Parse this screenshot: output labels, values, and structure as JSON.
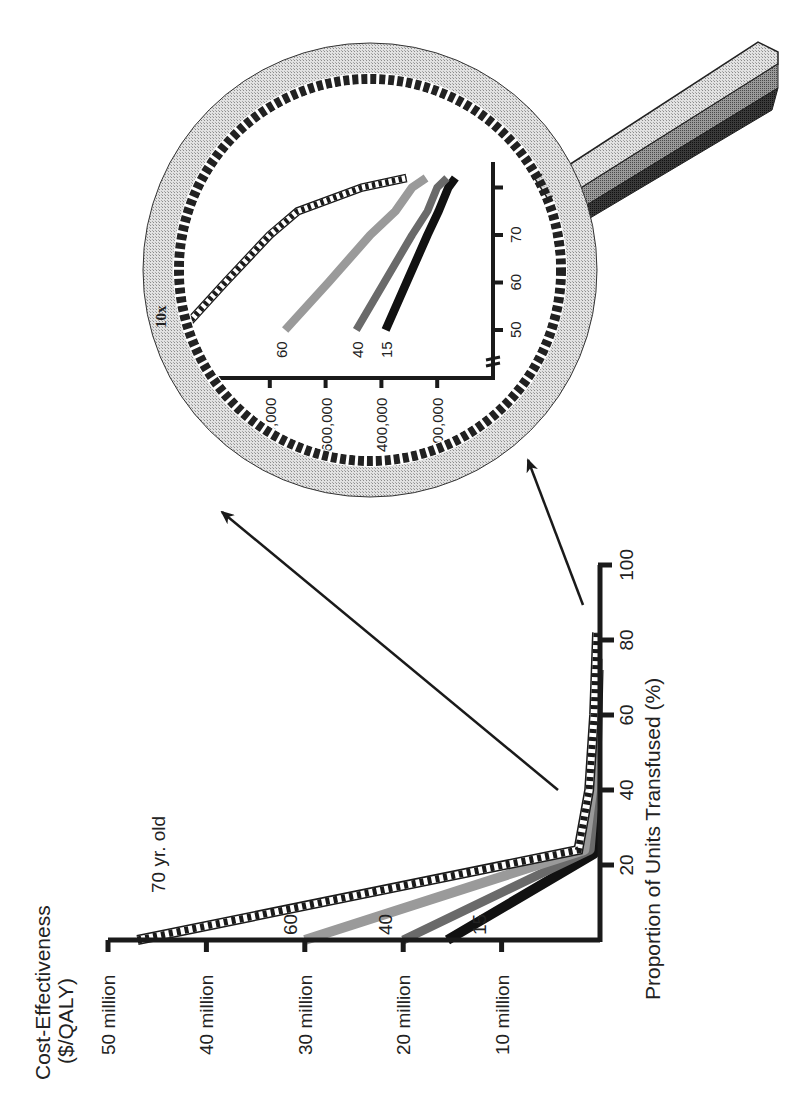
{
  "colors": {
    "axis": "#1a1a1a",
    "series_70": "#1a1a1a",
    "series_60": "#8a8a8a",
    "series_40": "#6e6e6e",
    "series_15": "#111111",
    "ring_outer": "#cfcfcf",
    "ring_inner": "#222222",
    "handle_light": "#d8d8d8",
    "handle_mid": "#9a9a9a",
    "handle_dark": "#2a2a2a"
  },
  "figure": {
    "orientation": "rotated 90° counter-clockwise",
    "magnifier_label": "10x"
  },
  "chart_data": [
    {
      "type": "line",
      "title": "",
      "ylabel_line1": "Cost-Effectiveness",
      "ylabel_line2": "($/QALY)",
      "xlabel": "Proportion of Units Transfused (%)",
      "ylim": [
        0,
        50000000
      ],
      "xlim": [
        0,
        100
      ],
      "yticks": [
        {
          "value": 10,
          "label": "10 million"
        },
        {
          "value": 20,
          "label": "20 million"
        },
        {
          "value": 30,
          "label": "30 million"
        },
        {
          "value": 40,
          "label": "40 million"
        },
        {
          "value": 50,
          "label": "50 million"
        }
      ],
      "xticks": [
        {
          "value": 20,
          "label": "20"
        },
        {
          "value": 40,
          "label": "40"
        },
        {
          "value": 60,
          "label": "60"
        },
        {
          "value": 80,
          "label": "80"
        },
        {
          "value": 100,
          "label": "100"
        }
      ],
      "y_units": "millions of $/QALY",
      "series": [
        {
          "name": "70 yr. old",
          "label": "70 yr. old",
          "style": "checkered-dashed",
          "points": [
            [
              0,
              47
            ],
            [
              24,
              2.2
            ],
            [
              40,
              1.1
            ],
            [
              60,
              0.6
            ],
            [
              82,
              0.3
            ]
          ]
        },
        {
          "name": "60",
          "label": "60",
          "style": "light-gray-thick",
          "points": [
            [
              0,
              30
            ],
            [
              24,
              1.6
            ],
            [
              40,
              0.8
            ],
            [
              60,
              0.4
            ],
            [
              75,
              0.25
            ]
          ]
        },
        {
          "name": "40",
          "label": "40",
          "style": "mid-gray-thick",
          "points": [
            [
              0,
              20
            ],
            [
              24,
              1.0
            ],
            [
              40,
              0.5
            ],
            [
              60,
              0.3
            ],
            [
              75,
              0.2
            ]
          ]
        },
        {
          "name": "15",
          "label": "15",
          "style": "black-thick",
          "points": [
            [
              0,
              15.5
            ],
            [
              23,
              0.6
            ],
            [
              40,
              0.4
            ],
            [
              60,
              0.25
            ],
            [
              72,
              0.15
            ]
          ]
        }
      ]
    },
    {
      "type": "line",
      "title": "10x inset (magnified view)",
      "xlabel": "Proportion of Units Transfused (%)",
      "ylabel": "Cost-Effectiveness ($/QALY)",
      "xlim": [
        45,
        85
      ],
      "ylim": [
        0,
        1100000
      ],
      "yticks": [
        {
          "value": 200,
          "label": "200,000"
        },
        {
          "value": 400,
          "label": "400,000"
        },
        {
          "value": 600,
          "label": "600,000"
        },
        {
          "value": 800,
          "label": "800,000"
        },
        {
          "value": 1000,
          "label": ""
        }
      ],
      "xticks": [
        {
          "value": 50,
          "label": "50"
        },
        {
          "value": 60,
          "label": "60"
        },
        {
          "value": 70,
          "label": "70"
        },
        {
          "value": 80,
          "label": ""
        }
      ],
      "y_units": "thousands of $/QALY",
      "axis_break": true,
      "series": [
        {
          "name": "70",
          "label": "70",
          "style": "checkered-dashed",
          "points": [
            [
              50,
              1115
            ],
            [
              60,
              960
            ],
            [
              70,
              800
            ],
            [
              75,
              700
            ],
            [
              80,
              470
            ],
            [
              82,
              310
            ]
          ]
        },
        {
          "name": "60",
          "label": "60",
          "style": "light-gray-thick",
          "points": [
            [
              50,
              745
            ],
            [
              60,
              590
            ],
            [
              70,
              440
            ],
            [
              75,
              350
            ],
            [
              80,
              290
            ],
            [
              82,
              240
            ]
          ]
        },
        {
          "name": "40",
          "label": "40",
          "style": "mid-gray-thick",
          "points": [
            [
              50,
              490
            ],
            [
              60,
              390
            ],
            [
              70,
              290
            ],
            [
              75,
              235
            ],
            [
              80,
              200
            ],
            [
              82,
              165
            ]
          ]
        },
        {
          "name": "15",
          "label": "15",
          "style": "black-thick",
          "points": [
            [
              50,
              385
            ],
            [
              60,
              310
            ],
            [
              70,
              235
            ],
            [
              75,
              195
            ],
            [
              80,
              160
            ],
            [
              82,
              135
            ]
          ]
        }
      ]
    }
  ]
}
